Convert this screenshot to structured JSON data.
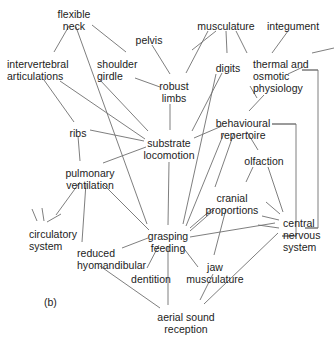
{
  "figure": {
    "panel_label": "(b)",
    "panel_label_pos": {
      "x": 44,
      "y": 296
    },
    "width": 336,
    "height": 351,
    "background_color": "#ffffff",
    "line_color": "#6f6f6f",
    "text_color": "#1c1c1c",
    "type": "network-diagram"
  },
  "nodes": [
    {
      "id": "flexible-neck",
      "label": "flexible\nneck",
      "x": 74,
      "y": 8,
      "align": "center"
    },
    {
      "id": "pelvis",
      "label": "pelvis",
      "x": 149,
      "y": 34,
      "align": "center"
    },
    {
      "id": "musculature-top",
      "label": "musculature",
      "x": 226,
      "y": 20,
      "align": "center"
    },
    {
      "id": "integument",
      "label": "integument",
      "x": 293,
      "y": 20,
      "align": "center"
    },
    {
      "id": "intervertebral-articulations",
      "label": "intervertebral\narticulations",
      "x": 7,
      "y": 58,
      "align": "left"
    },
    {
      "id": "shoulder-girdle",
      "label": "shoulder\ngirdle",
      "x": 97,
      "y": 58,
      "align": "left"
    },
    {
      "id": "digits",
      "label": "digits",
      "x": 228,
      "y": 62,
      "align": "center"
    },
    {
      "id": "thermal-osmotic-physiology",
      "label": "thermal and\nosmotic\nphysiology",
      "x": 253,
      "y": 58,
      "align": "left"
    },
    {
      "id": "robust-limbs",
      "label": "robust\nlimbs",
      "x": 174,
      "y": 80,
      "align": "center"
    },
    {
      "id": "ribs",
      "label": "ribs",
      "x": 78,
      "y": 127,
      "align": "center"
    },
    {
      "id": "behavioural-repertoire",
      "label": "behavioural\nrepertoire",
      "x": 243,
      "y": 117,
      "align": "center"
    },
    {
      "id": "substrate-locomotion",
      "label": "substrate\nlocomotion",
      "x": 169,
      "y": 137,
      "align": "center"
    },
    {
      "id": "olfaction",
      "label": "olfaction",
      "x": 264,
      "y": 155,
      "align": "center"
    },
    {
      "id": "pulmonary-ventilation",
      "label": "pulmonary\nventilation",
      "x": 90,
      "y": 167,
      "align": "center"
    },
    {
      "id": "cranial-proportions",
      "label": "cranial\nproportions",
      "x": 232,
      "y": 192,
      "align": "center"
    },
    {
      "id": "circulatory-system",
      "label": "circulatory\nsystem",
      "x": 29,
      "y": 228,
      "align": "left"
    },
    {
      "id": "grasping-feeding",
      "label": "grasping\nfeeding",
      "x": 168,
      "y": 230,
      "align": "center"
    },
    {
      "id": "central-nervous-system",
      "label": "central\nnervous\nsystem",
      "x": 283,
      "y": 217,
      "align": "left"
    },
    {
      "id": "reduced-hyomandibular",
      "label": "reduced\nhyomandibular",
      "x": 77,
      "y": 247,
      "align": "left"
    },
    {
      "id": "dentition",
      "label": "dentition",
      "x": 151,
      "y": 273,
      "align": "center"
    },
    {
      "id": "jaw-musculature",
      "label": "jaw\nmusculature",
      "x": 215,
      "y": 261,
      "align": "center"
    },
    {
      "id": "aerial-sound-reception",
      "label": "aerial sound\nreception",
      "x": 186,
      "y": 311,
      "align": "center"
    }
  ],
  "edges": [
    {
      "from": "flexible-neck",
      "to": "shoulder-girdle",
      "x1": 92,
      "y1": 25,
      "x2": 126,
      "y2": 52
    },
    {
      "from": "flexible-neck",
      "to": "intervertebral-articulations",
      "x1": 69,
      "y1": 26,
      "x2": 54,
      "y2": 52
    },
    {
      "from": "flexible-neck",
      "to": "grasping-feeding",
      "x1": 76,
      "y1": 27,
      "x2": 147,
      "y2": 224
    },
    {
      "from": "pelvis",
      "to": "robust-limbs",
      "x1": 152,
      "y1": 45,
      "x2": 170,
      "y2": 74
    },
    {
      "from": "musculature-top",
      "to": "robust-limbs",
      "x1": 208,
      "y1": 31,
      "x2": 186,
      "y2": 73
    },
    {
      "from": "musculature-top",
      "to": "musculature-stub-a",
      "x1": 216,
      "y1": 31,
      "x2": 192,
      "y2": 50
    },
    {
      "from": "musculature-top",
      "to": "digits",
      "x1": 226,
      "y1": 31,
      "x2": 227,
      "y2": 53
    },
    {
      "from": "musculature-top",
      "to": "musculature-stub-b",
      "x1": 236,
      "y1": 31,
      "x2": 247,
      "y2": 53
    },
    {
      "from": "integument",
      "to": "thermal-osmotic-physiology",
      "x1": 288,
      "y1": 31,
      "x2": 272,
      "y2": 53
    },
    {
      "from": "integument-right-stub",
      "to": "thermal-osmotic-physiology",
      "x1": 334,
      "y1": 48,
      "x2": 312,
      "y2": 53
    },
    {
      "from": "shoulder-girdle",
      "to": "robust-limbs",
      "x1": 135,
      "y1": 78,
      "x2": 160,
      "y2": 87
    },
    {
      "from": "shoulder-girdle",
      "to": "substrate-locomotion",
      "x1": 99,
      "y1": 79,
      "x2": 148,
      "y2": 131
    },
    {
      "from": "intervertebral-articulations",
      "to": "ribs",
      "x1": 44,
      "y1": 80,
      "x2": 74,
      "y2": 122
    },
    {
      "from": "intervertebral-articulations",
      "to": "substrate-locomotion",
      "x1": 60,
      "y1": 81,
      "x2": 145,
      "y2": 139
    },
    {
      "from": "digits",
      "to": "substrate-locomotion",
      "x1": 222,
      "y1": 73,
      "x2": 192,
      "y2": 131
    },
    {
      "from": "digits",
      "to": "grasping-feeding",
      "x1": 216,
      "y1": 74,
      "x2": 183,
      "y2": 224
    },
    {
      "from": "robust-limbs",
      "to": "substrate-locomotion",
      "x1": 170,
      "y1": 104,
      "x2": 170,
      "y2": 130
    },
    {
      "from": "thermal-osmotic-physiology",
      "to": "behavioural-repertoire",
      "x1": 264,
      "y1": 95,
      "x2": 249,
      "y2": 111
    },
    {
      "from": "thermal-osmotic-physiology",
      "to": "osmotic-right-stub",
      "x1": 288,
      "y1": 74,
      "x2": 303,
      "y2": 67
    },
    {
      "from": "thermal-osmotic-physiology",
      "to": "physiology-left-stub",
      "x1": 250,
      "y1": 86,
      "x2": 257,
      "y2": 98
    },
    {
      "from": "ribs",
      "to": "substrate-locomotion",
      "x1": 90,
      "y1": 130,
      "x2": 144,
      "y2": 141
    },
    {
      "from": "ribs",
      "to": "pulmonary-ventilation",
      "x1": 78,
      "y1": 136,
      "x2": 80,
      "y2": 161
    },
    {
      "from": "substrate-locomotion",
      "to": "behavioural-repertoire",
      "x1": 194,
      "y1": 138,
      "x2": 222,
      "y2": 126
    },
    {
      "from": "substrate-locomotion",
      "to": "grasping-feeding",
      "x1": 169,
      "y1": 162,
      "x2": 168,
      "y2": 225
    },
    {
      "from": "substrate-locomotion",
      "to": "pulmonary-ventilation",
      "x1": 146,
      "y1": 147,
      "x2": 103,
      "y2": 163
    },
    {
      "from": "behavioural-repertoire",
      "to": "olfaction",
      "x1": 247,
      "y1": 132,
      "x2": 258,
      "y2": 150
    },
    {
      "from": "behavioural-repertoire",
      "to": "cranial-proportions",
      "x1": 234,
      "y1": 133,
      "x2": 215,
      "y2": 187
    },
    {
      "from": "behavioural-repertoire",
      "to": "grasping-feeding",
      "x1": 224,
      "y1": 133,
      "x2": 186,
      "y2": 226
    },
    {
      "from": "behavioural-repertoire",
      "to": "bracket-inner",
      "x1": 272,
      "y1": 124,
      "x2": 296,
      "y2": 124
    },
    {
      "from": "olfaction",
      "to": "central-nervous-system",
      "x1": 268,
      "y1": 167,
      "x2": 283,
      "y2": 212
    },
    {
      "from": "olfaction",
      "to": "olfaction-stub",
      "x1": 253,
      "y1": 167,
      "x2": 246,
      "y2": 182
    },
    {
      "from": "cranial-proportions",
      "to": "grasping-feeding",
      "x1": 212,
      "y1": 209,
      "x2": 190,
      "y2": 228
    },
    {
      "from": "cranial-proportions",
      "to": "jaw-musculature",
      "x1": 226,
      "y1": 209,
      "x2": 214,
      "y2": 255
    },
    {
      "from": "pulmonary-ventilation",
      "to": "circulatory-system",
      "x1": 80,
      "y1": 182,
      "x2": 56,
      "y2": 215
    },
    {
      "from": "pulmonary-ventilation",
      "to": "reduced-hyomandibular",
      "x1": 86,
      "y1": 183,
      "x2": 82,
      "y2": 242
    },
    {
      "from": "pulmonary-ventilation",
      "to": "grasping-feeding",
      "x1": 103,
      "y1": 184,
      "x2": 149,
      "y2": 230
    },
    {
      "from": "circulatory-stub-1",
      "to": "circulatory-system",
      "x1": 32,
      "y1": 209,
      "x2": 37,
      "y2": 221
    },
    {
      "from": "circulatory-stub-2",
      "to": "circulatory-system",
      "x1": 42,
      "y1": 208,
      "x2": 44,
      "y2": 221
    },
    {
      "from": "circulatory-stub-3",
      "to": "circulatory-system",
      "x1": 61,
      "y1": 214,
      "x2": 47,
      "y2": 222
    },
    {
      "from": "reduced-hyomandibular",
      "to": "grasping-feeding",
      "x1": 122,
      "y1": 248,
      "x2": 148,
      "y2": 238
    },
    {
      "from": "reduced-hyomandibular",
      "to": "aerial-sound-reception",
      "x1": 100,
      "y1": 266,
      "x2": 160,
      "y2": 308
    },
    {
      "from": "grasping-feeding",
      "to": "dentition",
      "x1": 159,
      "y1": 245,
      "x2": 147,
      "y2": 268
    },
    {
      "from": "grasping-feeding",
      "to": "aerial-sound-reception",
      "x1": 168,
      "y1": 246,
      "x2": 168,
      "y2": 305
    },
    {
      "from": "grasping-feeding",
      "to": "jaw-musculature",
      "x1": 182,
      "y1": 246,
      "x2": 198,
      "y2": 267
    },
    {
      "from": "grasping-feeding",
      "to": "cranial-proportions-link",
      "x1": 190,
      "y1": 231,
      "x2": 214,
      "y2": 210
    },
    {
      "from": "grasping-feeding",
      "to": "central-nervous-system",
      "x1": 190,
      "y1": 237,
      "x2": 275,
      "y2": 223
    },
    {
      "from": "central-nervous-system",
      "to": "cns-stub-a",
      "x1": 280,
      "y1": 214,
      "x2": 266,
      "y2": 202
    },
    {
      "from": "central-nervous-system",
      "to": "cns-stub-b",
      "x1": 279,
      "y1": 220,
      "x2": 262,
      "y2": 216
    },
    {
      "from": "central-nervous-system",
      "to": "cns-stub-c",
      "x1": 279,
      "y1": 228,
      "x2": 258,
      "y2": 225
    },
    {
      "from": "central-nervous-system",
      "to": "aerial-sound-reception",
      "x1": 278,
      "y1": 233,
      "x2": 204,
      "y2": 304
    },
    {
      "from": "jaw-musculature",
      "to": "aerial-sound-reception",
      "x1": 213,
      "y1": 274,
      "x2": 200,
      "y2": 300
    },
    {
      "from": "bracket-inner-end",
      "to": "central-nervous-system",
      "x1": 296,
      "y1": 236,
      "x2": 282,
      "y2": 236
    },
    {
      "from": "bracket-outer-top",
      "to": "thermal-osmotic-physiology",
      "x1": 318,
      "y1": 70,
      "x2": 302,
      "y2": 70
    },
    {
      "from": "bracket-outer-bottom",
      "to": "central-nervous-system",
      "x1": 318,
      "y1": 228,
      "x2": 305,
      "y2": 228
    }
  ],
  "brackets": [
    {
      "id": "bracket-outer",
      "x": 318,
      "y_top": 70,
      "y_bottom": 228,
      "arm_left_top": 302,
      "arm_left_bottom": 305
    },
    {
      "id": "bracket-inner",
      "x": 296,
      "y_top": 124,
      "y_bottom": 236,
      "arm_left_top": 272,
      "arm_left_bottom": 282
    }
  ]
}
